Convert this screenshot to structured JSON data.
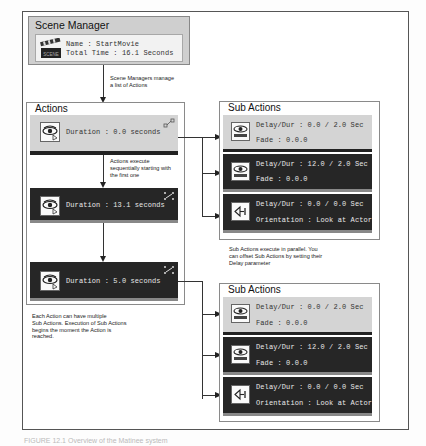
{
  "scene_manager": {
    "title": "Scene Manager",
    "icon": "clapperboard-icon",
    "icon_label": "SCENE",
    "name_line": "Name : StartMovie",
    "total_time_line": "Total Time : 16.1 Seconds"
  },
  "notes": {
    "scene_manager_note_1": "Scene Managers manage",
    "scene_manager_note_2": "a list of Actions",
    "actions_sequential_1": "Actions execute",
    "actions_sequential_2": "sequentially starting with",
    "actions_sequential_3": "the first one",
    "multiple_sub_1": "Each Action can have multiple",
    "multiple_sub_2": "Sub Actions. Execution of Sub Actions",
    "multiple_sub_3": "begins the moment the Action is",
    "multiple_sub_4": "reached.",
    "parallel_1": "Sub Actions execute in parallel.  You",
    "parallel_2": "can offset Sub Actions by setting their",
    "parallel_3": "Delay parameter"
  },
  "actions": {
    "title": "Actions",
    "items": [
      {
        "label": "Duration : 0.0 seconds",
        "style": "light",
        "icon": "camera-eye-icon",
        "corner_icon": "link-collapsed-icon"
      },
      {
        "label": "Duration : 13.1 seconds",
        "style": "dark",
        "icon": "camera-eye-icon",
        "corner_icon": "link-expand-icon"
      },
      {
        "label": "Duration : 5.0 seconds",
        "style": "dark",
        "icon": "camera-eye-icon",
        "corner_icon": "link-expand-icon"
      }
    ]
  },
  "sub_actions_groups": [
    {
      "title": "Sub Actions",
      "items": [
        {
          "line1": "Delay/Dur : 0.0 / 2.0 Sec",
          "line2": "Fade : 0.0.0",
          "style": "light",
          "icon": "fade-eye-icon"
        },
        {
          "line1": "Delay/Dur : 12.0 / 2.0 Sec",
          "line2": "Fade : 0.0.0",
          "style": "dark",
          "icon": "fade-eye-icon"
        },
        {
          "line1": "Delay/Dur : 0.0 / 0.0 Sec",
          "line2": "Orientation : Look at Actor",
          "style": "dark",
          "icon": "orientation-arrow-icon"
        }
      ]
    },
    {
      "title": "Sub Actions",
      "items": [
        {
          "line1": "Delay/Dur : 0.0 / 2.0 Sec",
          "line2": "Fade : 0.0.0",
          "style": "light",
          "icon": "fade-eye-icon"
        },
        {
          "line1": "Delay/Dur : 12.0 / 2.0 Sec",
          "line2": "Fade : 0.0.0",
          "style": "dark",
          "icon": "fade-eye-icon"
        },
        {
          "line1": "Delay/Dur : 0.0 / 0.0 Sec",
          "line2": "Orientation : Look at Actor",
          "style": "dark",
          "icon": "orientation-arrow-icon"
        }
      ]
    }
  ],
  "caption": "FIGURE 12.1   Overview of the Matinee system"
}
